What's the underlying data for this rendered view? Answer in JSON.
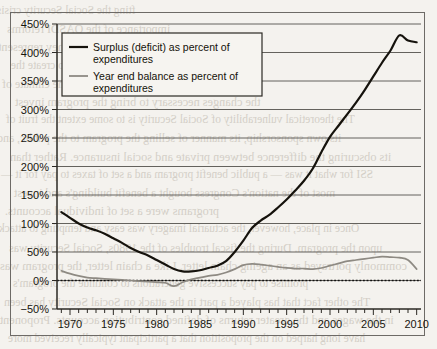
{
  "page": {
    "background_color": "#f4f2ee",
    "frame_color": "#6d6a66",
    "bleed_through_lines": [
      "fting the Social Security crisis.",
      "importance of the OASDI reforms",
      "programs of the past three decades. They represent",
      "tions of Social Security to create the",
      "tial  fund they demonstrated that the climate of",
      "the changes necessary to bring the program invest",
      "The theoretical vulnerability of Social Security is to some extent the fruit of",
      "its own sponsorship, its manner of selling the program to the public, and",
      "its obscuring the difference between private and social insurance. Rather than",
      "SSI for what it was — a public benefit program and a set of taxes to pay for it —",
      "most of the nation's Congress bought a benefit building's and invest",
      "programs were a set of individual accounts.",
      "Once in place, however, the actuarial imagery was easy and tempting to attack.",
      "upon the program. During the fiscal troubles of the 1980s, Social Security was",
      "commonly portrayed as an ageing chain letter. Like a chain letter, the program was",
      "promise to pay successive generations to continue the program's",
      "The other  fact  that has played a part in the attack on Social Security has been",
      "in the wages and the greater returns of defined contribution accounts. Proponents",
      "have long harped on the proposition that a participant typically received more"
    ]
  },
  "chart_data": {
    "type": "line",
    "title": "",
    "xlabel": "",
    "ylabel": "",
    "xlim": [
      1968.5,
      2010.5
    ],
    "ylim": [
      -50,
      450
    ],
    "ytick_step": 50,
    "grid": true,
    "zero_reference_line": true,
    "legend_position": "top-left-inside",
    "ytick_labels": [
      "450%",
      "400%",
      "350%",
      "300%",
      "250%",
      "200%",
      "150%",
      "100%",
      "50%",
      "0%",
      "−50%"
    ],
    "ytick_values": [
      450,
      400,
      350,
      300,
      250,
      200,
      150,
      100,
      50,
      0,
      -50
    ],
    "xtick_labels": [
      "1970",
      "1975",
      "1980",
      "1985",
      "1990",
      "1995",
      "2000",
      "2005",
      "2010"
    ],
    "xtick_values": [
      1970,
      1975,
      1980,
      1985,
      1990,
      1995,
      2000,
      2005,
      2010
    ],
    "xtick_minor_step": 1,
    "x": [
      1969,
      1970,
      1971,
      1972,
      1973,
      1974,
      1975,
      1976,
      1977,
      1978,
      1979,
      1980,
      1981,
      1982,
      1983,
      1984,
      1985,
      1986,
      1987,
      1988,
      1989,
      1990,
      1991,
      1992,
      1993,
      1994,
      1995,
      1996,
      1997,
      1998,
      1999,
      2000,
      2001,
      2002,
      2003,
      2004,
      2005,
      2006,
      2007,
      2008,
      2009,
      2010
    ],
    "series": [
      {
        "name": "Surplus (deficit) as percent of expenditures",
        "color": "#15120c",
        "style": "solid-black",
        "values": [
          120,
          110,
          100,
          93,
          88,
          82,
          74,
          66,
          57,
          50,
          44,
          36,
          28,
          20,
          16,
          16,
          18,
          22,
          26,
          34,
          50,
          70,
          92,
          105,
          115,
          128,
          142,
          158,
          175,
          196,
          225,
          252,
          272,
          292,
          312,
          334,
          358,
          382,
          404,
          430,
          421,
          418
        ]
      },
      {
        "name": "Year end balance as percent of expenditures",
        "color": "#8e8a83",
        "style": "solid-gray",
        "values": [
          17,
          12,
          8,
          5,
          4,
          3,
          2,
          1,
          0,
          -1,
          -2,
          -3,
          -4,
          -10,
          -3,
          2,
          5,
          8,
          10,
          14,
          20,
          27,
          29,
          28,
          26,
          24,
          22,
          21,
          21,
          20,
          22,
          26,
          30,
          34,
          36,
          38,
          40,
          42,
          41,
          40,
          36,
          20
        ]
      }
    ]
  },
  "legend": {
    "entries": [
      {
        "label_line1": "Surplus (deficit) as percent of",
        "label_line2": "expenditures",
        "swatch": "black-line-swatch"
      },
      {
        "label_line1": "Year end balance as percent of",
        "label_line2": "expenditures",
        "swatch": "gray-line-swatch"
      }
    ]
  }
}
